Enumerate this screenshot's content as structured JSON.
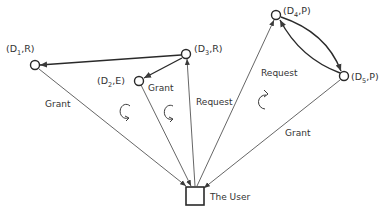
{
  "diagram": {
    "nodes": [
      {
        "id": "D1",
        "label_pre": "(D",
        "sub": "1",
        "label_post": ",R)"
      },
      {
        "id": "D2",
        "label_pre": "(D",
        "sub": "2",
        "label_post": ",E)"
      },
      {
        "id": "D3",
        "label_pre": "(D",
        "sub": "3",
        "label_post": ",R)"
      },
      {
        "id": "D4",
        "label_pre": "(D",
        "sub": "4",
        "label_post": ",P)"
      },
      {
        "id": "D5",
        "label_pre": "(D",
        "sub": "5",
        "label_post": ",P)"
      }
    ],
    "user": {
      "label": "The User"
    },
    "edges": [
      {
        "from": "D1",
        "to": "User",
        "label": "Grant"
      },
      {
        "from": "D2",
        "to": "User",
        "label": "Grant"
      },
      {
        "from": "User",
        "to": "D3",
        "label": "Request"
      },
      {
        "from": "User",
        "to": "D4",
        "label": "Request"
      },
      {
        "from": "D5",
        "to": "User",
        "label": "Grant"
      },
      {
        "from": "D3",
        "to": "D1",
        "label": ""
      },
      {
        "from": "D3",
        "to": "D2",
        "label": ""
      },
      {
        "from": "D4",
        "to": "D5",
        "label": ""
      },
      {
        "from": "D5",
        "to": "D4",
        "label": ""
      }
    ],
    "cycle_markers": [
      "clockwise",
      "clockwise",
      "clockwise"
    ],
    "colors": {
      "line": "#3a3a3a",
      "text": "#333333",
      "background": "#ffffff"
    }
  }
}
